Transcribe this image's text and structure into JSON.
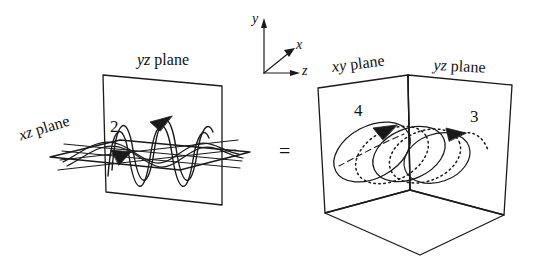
{
  "figure": {
    "type": "diagram",
    "equals_sign": "="
  },
  "axes": {
    "y": "y",
    "x": "x",
    "z": "z"
  },
  "left_diagram": {
    "plane_vertical_label_italic": "yz",
    "plane_vertical_label_roman": " plane",
    "plane_horizontal_label_italic": "xz",
    "plane_horizontal_label_roman": " plane",
    "component_number": "2"
  },
  "right_diagram": {
    "plane_left_label_italic": "xy",
    "plane_left_label_roman": " plane",
    "plane_right_label_italic": "yz",
    "plane_right_label_roman": " plane",
    "orbit_number_left": "4",
    "orbit_number_right": "3"
  },
  "colors": {
    "ink": "#1a1a1a",
    "background": "#ffffff"
  }
}
